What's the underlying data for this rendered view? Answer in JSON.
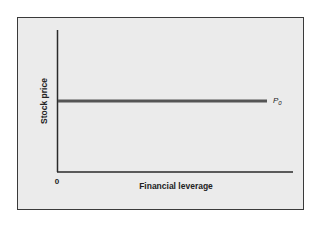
{
  "chart_data": {
    "type": "line",
    "title": "",
    "xlabel": "Financial leverage",
    "ylabel": "Stock price",
    "x_tick_labels": [
      "0"
    ],
    "xlim": [
      0,
      1
    ],
    "ylim": [
      0,
      1
    ],
    "grid": false,
    "legend": "none",
    "series": [
      {
        "name": "P0",
        "label_main": "P",
        "label_sub": "0",
        "x": [
          0,
          1
        ],
        "y": [
          0.5,
          0.5
        ],
        "color": "#555555"
      }
    ]
  },
  "colors": {
    "background": "#ebebeb",
    "axis": "#2a2a2a",
    "frame": "#3a3a3a"
  }
}
